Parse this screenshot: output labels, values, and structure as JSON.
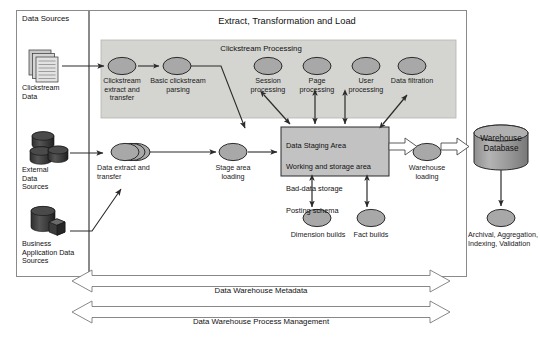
{
  "diagram": {
    "title": "Extract, Transformation and Load",
    "panels": {
      "data_sources_label": "Data Sources",
      "clickstream_processing_label": "Clickstream  Processing"
    },
    "sources": [
      {
        "id": "clickstream-data",
        "icon": "document-stack-icon",
        "label": "Clickstream\nData"
      },
      {
        "id": "external-data-sources",
        "icon": "database-cluster-icon",
        "label": "External\nData\nSources"
      },
      {
        "id": "business-application-data-sources",
        "icon": "database-cube-icon",
        "label": "Business\nApplication Data\nSources"
      }
    ],
    "processes": [
      {
        "id": "clickstream-extract-and-transfer",
        "label": "Clickstream\nextract and\ntransfer"
      },
      {
        "id": "basic-clickstream-parsing",
        "label": "Basic clickstream\nparsing"
      },
      {
        "id": "session-processing",
        "label": "Session\nprocessing"
      },
      {
        "id": "page-processing",
        "label": "Page\nprocessing"
      },
      {
        "id": "user-processing",
        "label": "User\nprocessing"
      },
      {
        "id": "data-filtration",
        "label": "Data\nfiltration"
      },
      {
        "id": "data-extract-and-transfer",
        "label": "Data extract and\ntransfer"
      },
      {
        "id": "stage-area-loading",
        "label": "Stage area\nloading"
      },
      {
        "id": "dimension-builds",
        "label": "Dimension\nbuilds"
      },
      {
        "id": "fact-builds",
        "label": "Fact builds"
      },
      {
        "id": "warehouse-loading",
        "label": "Warehouse\nloading"
      },
      {
        "id": "archival-aggregation-indexing-validation",
        "label": "Archival,\nAggregation,\nIndexing,\nValidation"
      }
    ],
    "staging_area": {
      "lines": [
        "Data  Staging  Area",
        "Working and storage area",
        "Bad-data storage",
        "Posting schema"
      ]
    },
    "warehouse": {
      "id": "warehouse-database",
      "label": "Warehouse\nDatabase"
    },
    "banners": [
      {
        "id": "data-warehouse-metadata",
        "label": "Data Warehouse  Metadata"
      },
      {
        "id": "data-warehouse-process-management",
        "label": "Data Warehouse Process Management"
      }
    ],
    "colors": {
      "node_fill": "#a8a8a8",
      "band_fill": "#d4d4d0",
      "staging_fill": "#c2c2c2",
      "db_fill": "#9d9d9d",
      "stroke": "#2b2b2b",
      "frame": "#8a8a8a"
    }
  }
}
